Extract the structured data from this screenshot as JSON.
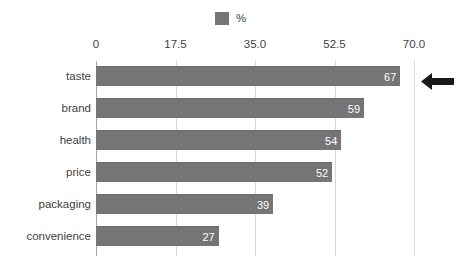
{
  "legend": {
    "swatch_color": "#757575",
    "label": "%"
  },
  "axis": {
    "tick_labels": [
      "0",
      "17.5",
      "35.0",
      "52.5",
      "70.0"
    ],
    "tick_values": [
      0,
      17.5,
      35.0,
      52.5,
      70.0
    ]
  },
  "annotation": {
    "arrow_name": "arrow-left-icon",
    "arrow_color": "#1a1a1a",
    "points_to": "taste"
  },
  "chart_data": {
    "type": "bar",
    "orientation": "horizontal",
    "title": "",
    "subtitle": "",
    "xlabel": "",
    "ylabel": "",
    "xlim": [
      0,
      70
    ],
    "grid": true,
    "legend_position": "top-center",
    "categories": [
      "taste",
      "brand",
      "health",
      "price",
      "packaging",
      "convenience"
    ],
    "values": [
      67,
      59,
      54,
      52,
      39,
      27
    ],
    "value_labels": [
      "67",
      "59",
      "54",
      "52",
      "39",
      "27"
    ],
    "series": [
      {
        "name": "%",
        "color": "#757575",
        "values": [
          67,
          59,
          54,
          52,
          39,
          27
        ]
      }
    ],
    "annotations": [
      {
        "type": "arrow",
        "direction": "left",
        "target_category": "taste"
      }
    ]
  },
  "colors": {
    "bar": "#757575",
    "gridline": "#d6d6d6",
    "axis": "#a8a8a8",
    "text": "#3f3f3f",
    "value_text": "#ffffff",
    "background": "#ffffff"
  }
}
